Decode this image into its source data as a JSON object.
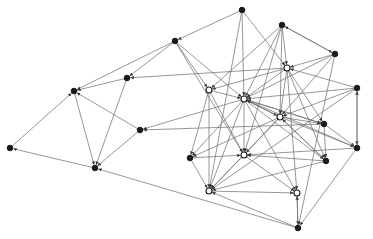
{
  "diagram": {
    "type": "directed-network-graph",
    "width": 373,
    "height": 239,
    "colors": {
      "edge": "#6a6a6a",
      "node": "#1a1a1a",
      "background": "#ffffff"
    },
    "nodes": [
      {
        "id": "A",
        "x": 242,
        "y": 10,
        "style": "filled"
      },
      {
        "id": "B",
        "x": 282,
        "y": 25,
        "style": "filled"
      },
      {
        "id": "C",
        "x": 175,
        "y": 41,
        "style": "filled"
      },
      {
        "id": "D",
        "x": 335,
        "y": 54,
        "style": "filled"
      },
      {
        "id": "E",
        "x": 127,
        "y": 78,
        "style": "filled"
      },
      {
        "id": "F",
        "x": 74,
        "y": 91,
        "style": "filled"
      },
      {
        "id": "G",
        "x": 287,
        "y": 68,
        "style": "open"
      },
      {
        "id": "H",
        "x": 209,
        "y": 90,
        "style": "open"
      },
      {
        "id": "I",
        "x": 244,
        "y": 99,
        "style": "open"
      },
      {
        "id": "J",
        "x": 357,
        "y": 88,
        "style": "filled"
      },
      {
        "id": "K",
        "x": 280,
        "y": 117,
        "style": "open"
      },
      {
        "id": "L",
        "x": 324,
        "y": 124,
        "style": "filled"
      },
      {
        "id": "M",
        "x": 140,
        "y": 130,
        "style": "filled"
      },
      {
        "id": "N",
        "x": 10,
        "y": 148,
        "style": "filled"
      },
      {
        "id": "O",
        "x": 190,
        "y": 158,
        "style": "filled"
      },
      {
        "id": "P",
        "x": 244,
        "y": 155,
        "style": "open"
      },
      {
        "id": "Q",
        "x": 357,
        "y": 148,
        "style": "filled"
      },
      {
        "id": "R",
        "x": 326,
        "y": 161,
        "style": "filled"
      },
      {
        "id": "S",
        "x": 95,
        "y": 168,
        "style": "filled"
      },
      {
        "id": "T",
        "x": 209,
        "y": 191,
        "style": "open"
      },
      {
        "id": "U",
        "x": 297,
        "y": 193,
        "style": "open"
      },
      {
        "id": "V",
        "x": 298,
        "y": 228,
        "style": "filled"
      }
    ],
    "edges": [
      [
        "A",
        "C"
      ],
      [
        "A",
        "I"
      ],
      [
        "A",
        "G"
      ],
      [
        "A",
        "T"
      ],
      [
        "B",
        "D"
      ],
      [
        "D",
        "B"
      ],
      [
        "B",
        "G"
      ],
      [
        "B",
        "I"
      ],
      [
        "B",
        "K"
      ],
      [
        "B",
        "H"
      ],
      [
        "B",
        "P"
      ],
      [
        "C",
        "F"
      ],
      [
        "C",
        "E"
      ],
      [
        "C",
        "H"
      ],
      [
        "C",
        "P"
      ],
      [
        "C",
        "I"
      ],
      [
        "D",
        "G"
      ],
      [
        "D",
        "I"
      ],
      [
        "D",
        "K"
      ],
      [
        "D",
        "V"
      ],
      [
        "E",
        "F"
      ],
      [
        "E",
        "S"
      ],
      [
        "G",
        "E"
      ],
      [
        "F",
        "S"
      ],
      [
        "N",
        "F"
      ],
      [
        "S",
        "N"
      ],
      [
        "V",
        "S"
      ],
      [
        "M",
        "F"
      ],
      [
        "M",
        "S"
      ],
      [
        "I",
        "M"
      ],
      [
        "L",
        "M"
      ],
      [
        "G",
        "I"
      ],
      [
        "G",
        "H"
      ],
      [
        "G",
        "K"
      ],
      [
        "G",
        "L"
      ],
      [
        "G",
        "R"
      ],
      [
        "G",
        "U"
      ],
      [
        "H",
        "I"
      ],
      [
        "H",
        "O"
      ],
      [
        "H",
        "T"
      ],
      [
        "H",
        "P"
      ],
      [
        "J",
        "I"
      ],
      [
        "J",
        "G"
      ],
      [
        "J",
        "Q"
      ],
      [
        "J",
        "T"
      ],
      [
        "J",
        "K"
      ],
      [
        "I",
        "K"
      ],
      [
        "K",
        "I"
      ],
      [
        "I",
        "L"
      ],
      [
        "I",
        "P"
      ],
      [
        "I",
        "R"
      ],
      [
        "I",
        "U"
      ],
      [
        "I",
        "T"
      ],
      [
        "I",
        "O"
      ],
      [
        "K",
        "P"
      ],
      [
        "K",
        "L"
      ],
      [
        "K",
        "O"
      ],
      [
        "K",
        "T"
      ],
      [
        "K",
        "R"
      ],
      [
        "K",
        "Q"
      ],
      [
        "L",
        "I"
      ],
      [
        "L",
        "R"
      ],
      [
        "L",
        "Q"
      ],
      [
        "Q",
        "P"
      ],
      [
        "Q",
        "I"
      ],
      [
        "Q",
        "V"
      ],
      [
        "Q",
        "J"
      ],
      [
        "R",
        "T"
      ],
      [
        "R",
        "P"
      ],
      [
        "O",
        "P"
      ],
      [
        "O",
        "T"
      ],
      [
        "P",
        "T"
      ],
      [
        "P",
        "U"
      ],
      [
        "T",
        "U"
      ],
      [
        "U",
        "V"
      ],
      [
        "V",
        "T"
      ],
      [
        "V",
        "U"
      ],
      [
        "R",
        "K"
      ]
    ]
  }
}
